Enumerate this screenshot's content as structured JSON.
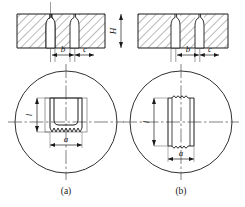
{
  "figure": {
    "type": "engineering-drawing",
    "colors": {
      "line": "#1a1a1a",
      "thin_line": "#5a5a5a",
      "hatch": "#3a3a3a",
      "center_line": "#4a4a4a",
      "background": "#ffffff"
    },
    "section_view": {
      "name": "plate-section",
      "dimension_labels": [
        {
          "id": "b-left",
          "text": "b"
        },
        {
          "id": "c-left",
          "text": "c"
        },
        {
          "id": "H",
          "text": "H"
        },
        {
          "id": "b-right",
          "text": "b"
        },
        {
          "id": "c-right",
          "text": "c"
        }
      ]
    },
    "detail_a": {
      "name": "detail-view-a",
      "caption": "(a)",
      "dimension_labels": [
        {
          "id": "l-a",
          "text": "l"
        },
        {
          "id": "a-a",
          "text": "a"
        }
      ]
    },
    "detail_b": {
      "name": "detail-view-b",
      "caption": "(b)",
      "dimension_labels": [
        {
          "id": "l-b",
          "text": "l"
        },
        {
          "id": "a-b",
          "text": "a"
        }
      ]
    }
  }
}
